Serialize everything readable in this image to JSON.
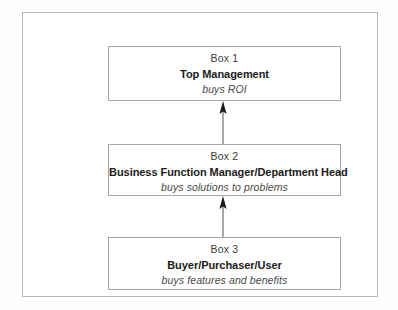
{
  "diagram": {
    "type": "flow-hierarchy",
    "direction": "bottom-to-top",
    "frame": {
      "border_color": "#b9b9b9",
      "background": "#ffffff"
    },
    "box_border_color": "#a6a6a6",
    "boxes": [
      {
        "id": "box-1",
        "label": "Box 1",
        "title": "Top Management",
        "subtitle": "buys ROI"
      },
      {
        "id": "box-2",
        "label": "Box 2",
        "title": "Business Function Manager/Department Head",
        "subtitle": "buys solutions to problems"
      },
      {
        "id": "box-3",
        "label": "Box 3",
        "title": "Buyer/Purchaser/User",
        "subtitle": "buys features and benefits"
      }
    ],
    "connectors": [
      {
        "id": "connector-3-to-2",
        "from": "box-3",
        "to": "box-2",
        "arrow": "up-arrow-icon"
      },
      {
        "id": "connector-2-to-1",
        "from": "box-2",
        "to": "box-1",
        "arrow": "up-arrow-icon"
      }
    ]
  }
}
